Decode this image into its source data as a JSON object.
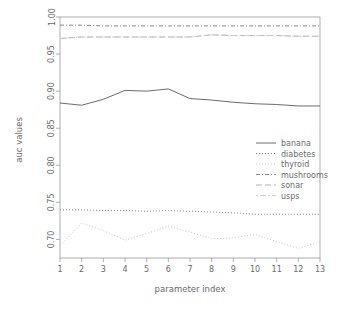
{
  "chart_data": {
    "type": "line",
    "title": "",
    "xlabel": "parameter index",
    "ylabel": "auc values",
    "xlim": [
      1,
      13
    ],
    "ylim": [
      0.675,
      1.0
    ],
    "grid": false,
    "legend_position": "center-right",
    "x": [
      1,
      2,
      3,
      4,
      5,
      6,
      7,
      8,
      9,
      10,
      11,
      12,
      13
    ],
    "xticks": [
      "1",
      "2",
      "3",
      "4",
      "5",
      "6",
      "7",
      "8",
      "9",
      "10",
      "11",
      "12",
      "13"
    ],
    "yticks": [
      "0.70",
      "0.75",
      "0.80",
      "0.85",
      "0.90",
      "0.95",
      "1.00"
    ],
    "ytick_values": [
      0.7,
      0.75,
      0.8,
      0.85,
      0.9,
      0.95,
      1.0
    ],
    "series": [
      {
        "name": "banana",
        "linestyle": "solid",
        "dash": "none",
        "color": "#5a5a5a",
        "values": [
          0.884,
          0.881,
          0.889,
          0.901,
          0.9,
          0.903,
          0.89,
          0.888,
          0.885,
          0.883,
          0.882,
          0.88,
          0.88
        ]
      },
      {
        "name": "diabetes",
        "linestyle": "dotted",
        "dash": "1,2",
        "color": "#767676",
        "values": [
          0.74,
          0.74,
          0.739,
          0.739,
          0.738,
          0.739,
          0.738,
          0.737,
          0.736,
          0.734,
          0.734,
          0.734,
          0.734
        ]
      },
      {
        "name": "thyroid",
        "linestyle": "dotted-light",
        "dash": "1,2",
        "color": "#c0c0c0",
        "values": [
          0.692,
          0.722,
          0.712,
          0.699,
          0.708,
          0.718,
          0.71,
          0.701,
          0.702,
          0.707,
          0.697,
          0.688,
          0.697
        ]
      },
      {
        "name": "mushrooms",
        "linestyle": "dashdot",
        "dash": "4,2,1,2",
        "color": "#7a7a7a",
        "values": [
          0.989,
          0.989,
          0.988,
          0.988,
          0.988,
          0.988,
          0.988,
          0.988,
          0.988,
          0.988,
          0.988,
          0.988,
          0.988
        ]
      },
      {
        "name": "sonar",
        "linestyle": "longdash",
        "dash": "6,3",
        "color": "#a8a8a8",
        "values": [
          0.971,
          0.973,
          0.973,
          0.973,
          0.973,
          0.973,
          0.973,
          0.976,
          0.975,
          0.975,
          0.975,
          0.974,
          0.974
        ]
      },
      {
        "name": "usps",
        "linestyle": "twodash",
        "dash": "2,2,6,2",
        "color": "#cccccc",
        "values": [
          0.971,
          0.973,
          0.973,
          0.973,
          0.973,
          0.973,
          0.973,
          0.976,
          0.975,
          0.975,
          0.975,
          0.974,
          0.974
        ]
      }
    ]
  },
  "legend": {
    "entries": [
      {
        "label": "banana"
      },
      {
        "label": "diabetes"
      },
      {
        "label": "thyroid"
      },
      {
        "label": "mushrooms"
      },
      {
        "label": "sonar"
      },
      {
        "label": "usps"
      }
    ]
  }
}
